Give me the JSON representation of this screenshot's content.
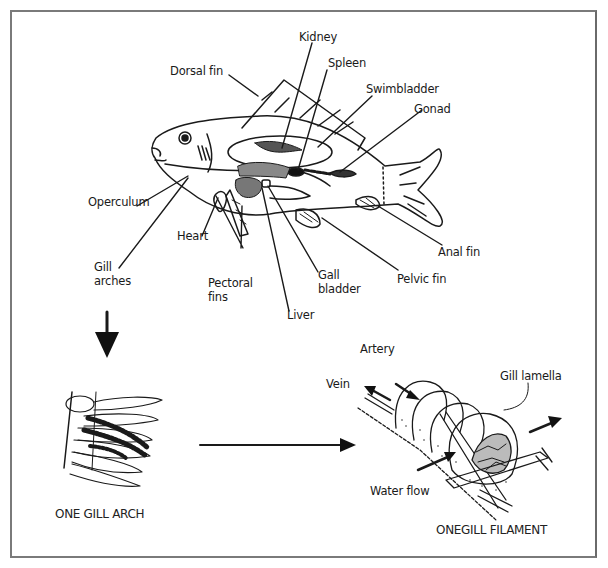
{
  "figure": {
    "fish_labels": {
      "kidney": "Kidney",
      "dorsal_fin": "Dorsal fin",
      "spleen": "Spleen",
      "swimbladder": "Swimbladder",
      "gonad": "Gonad",
      "operculum": "Operculum",
      "heart": "Heart",
      "gill_arches": "Gill\narches",
      "pectoral_fins": "Pectoral\nfins",
      "liver": "Liver",
      "gall_bladder": "Gall\nbladder",
      "pelvic_fin": "Pelvic fin",
      "anal_fin": "Anal fin"
    },
    "gill_arch": {
      "caption": "ONE GILL ARCH"
    },
    "gill_filament": {
      "caption": "ONEGILL FILAMENT",
      "labels": {
        "artery": "Artery",
        "vein": "Vein",
        "gill_lamella": "Gill lamella",
        "water_flow": "Water flow"
      }
    },
    "colors": {
      "ink": "#1a1a1a",
      "border": "#7a7a7a",
      "background": "#ffffff"
    }
  }
}
